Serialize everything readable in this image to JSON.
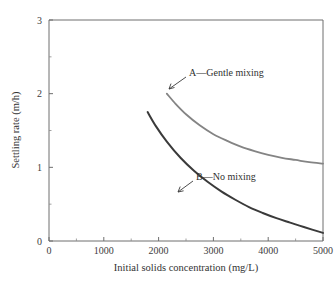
{
  "chart_data": {
    "type": "line",
    "title": "",
    "xlabel": "Initial solids concentration (mg/L)",
    "ylabel": "Settling rate (m/h)",
    "xlim": [
      0,
      5000
    ],
    "ylim": [
      0,
      3
    ],
    "xticks": [
      0,
      1000,
      2000,
      3000,
      4000,
      5000
    ],
    "xtick_labels": [
      "0",
      "1000",
      "2000",
      "3000",
      "4000",
      "5000"
    ],
    "yticks": [
      0,
      1,
      2,
      3
    ],
    "ytick_labels": [
      "0",
      "1",
      "2",
      "3"
    ],
    "xminor_ticks": [
      500,
      1500,
      2500,
      3500,
      4500
    ],
    "yminor_ticks": [
      0.5,
      1.5,
      2.5
    ],
    "grid": false,
    "legend_position": "inline-annotations",
    "series": [
      {
        "name": "A—Gentle mixing",
        "color": "#848484",
        "label_text": "A—Gentle mixing",
        "x": [
          2150,
          2300,
          2500,
          2750,
          3000,
          3250,
          3500,
          3750,
          4000,
          4250,
          4500,
          4750,
          5000
        ],
        "y": [
          2.0,
          1.87,
          1.72,
          1.57,
          1.45,
          1.36,
          1.28,
          1.22,
          1.17,
          1.13,
          1.1,
          1.07,
          1.05
        ]
      },
      {
        "name": "B—No mixing",
        "color": "#3a3a3a",
        "label_text": "B—No mixing",
        "x": [
          1800,
          1950,
          2150,
          2400,
          2650,
          2900,
          3150,
          3400,
          3650,
          3900,
          4150,
          4400,
          4650,
          5000
        ],
        "y": [
          1.75,
          1.56,
          1.35,
          1.13,
          0.95,
          0.8,
          0.67,
          0.56,
          0.46,
          0.38,
          0.31,
          0.25,
          0.19,
          0.11
        ]
      }
    ],
    "annotations": [
      {
        "text": "A—Gentle mixing",
        "data_x": 2700,
        "data_y": 2.28
      },
      {
        "text": "B—No mixing",
        "data_x": 2900,
        "data_y": 1.02
      }
    ]
  },
  "colors": {
    "background": "#ffffff",
    "axis": "#6f6f6f",
    "text": "#333333",
    "series_a": "#848484",
    "series_b": "#3a3a3a"
  }
}
